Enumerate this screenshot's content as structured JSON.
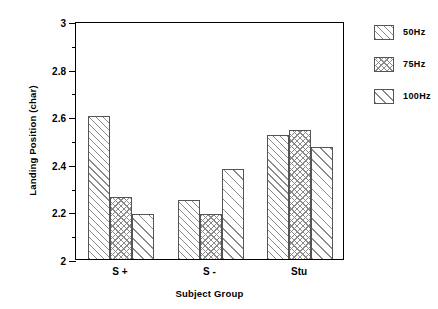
{
  "chart_data": {
    "type": "bar",
    "title": "",
    "xlabel": "Subject Group",
    "ylabel": "Landing Position (char)",
    "categories": [
      "S +",
      "S -",
      "Stu"
    ],
    "series": [
      {
        "name": "50Hz",
        "values": [
          2.6,
          2.25,
          2.52
        ],
        "pattern": "diagonal-dense"
      },
      {
        "name": "75Hz",
        "values": [
          2.26,
          2.19,
          2.54
        ],
        "pattern": "cross-hatch"
      },
      {
        "name": "100Hz",
        "values": [
          2.19,
          2.38,
          2.47
        ],
        "pattern": "diagonal-wide"
      }
    ],
    "ylim": [
      2,
      3
    ],
    "ytick_major": [
      "2",
      "2.2",
      "2.4",
      "2.6",
      "2.8",
      "3"
    ],
    "ytick_major_values": [
      2,
      2.2,
      2.4,
      2.6,
      2.8,
      3
    ],
    "ytick_minor_values": [
      2.1,
      2.3,
      2.5,
      2.7,
      2.9
    ],
    "grid": false,
    "legend_position": "right",
    "colors": {
      "axis": "#000000",
      "hatch": "#8a8a8a",
      "bar_border": "#555555",
      "background": "#ffffff"
    }
  },
  "legend": {
    "entries": [
      {
        "label": "50Hz"
      },
      {
        "label": "75Hz"
      },
      {
        "label": "100Hz"
      }
    ]
  }
}
